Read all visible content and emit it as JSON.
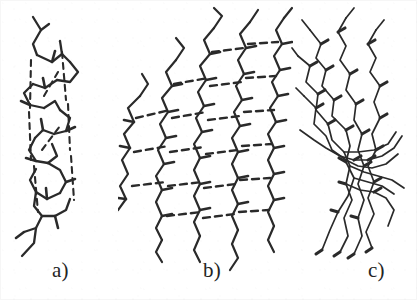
{
  "figure": {
    "type": "scientific-line-drawing",
    "background_color": "#ffffff",
    "ink_color": "#2a2a2a",
    "width": 417,
    "height": 300
  },
  "panels": [
    {
      "id": "a",
      "caption": "a)",
      "structure_name": "alpha-helix",
      "description": "narrow right-handed coiled backbone stick model",
      "bond_style": "solid-stick-backbone",
      "hydrogen_bonds": "dashed, running vertically along the helix axis",
      "strand_count": 1,
      "orientation": "vertical",
      "has_dashed_bonds": true
    },
    {
      "id": "b",
      "caption": "b)",
      "structure_name": "beta-sheet",
      "description": "parallel extended zigzag strands forming a pleated sheet",
      "bond_style": "solid-stick-backbone",
      "hydrogen_bonds": "dashed, horizontal rungs between adjacent strands",
      "strand_count": 5,
      "orientation": "vertical strands",
      "has_dashed_bonds": true
    },
    {
      "id": "c",
      "caption": "c)",
      "structure_name": "random-coil",
      "description": "irregular thin wavy chains converging toward a central axis",
      "bond_style": "thin-wavy-backbone",
      "hydrogen_bonds": "none shown",
      "strand_count": 6,
      "orientation": "splayed diagonal",
      "has_dashed_bonds": false
    }
  ]
}
